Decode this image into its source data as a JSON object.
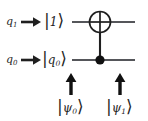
{
  "figure": {
    "type": "quantum-circuit-diagram",
    "background_color": "#ffffff",
    "ink_color": "#1f1f1f"
  },
  "wires": [
    {
      "id": "q1",
      "register_label": "q",
      "register_subscript": "1",
      "arrow": "→",
      "initial_state_ket": {
        "left_bar": "|",
        "inner": "1",
        "inner_subscript": "",
        "right_angle": "⟩",
        "full": "|1⟩"
      },
      "role": "target",
      "gate_symbol": "⊕"
    },
    {
      "id": "q0",
      "register_label": "q",
      "register_subscript": "0",
      "arrow": "→",
      "initial_state_ket": {
        "left_bar": "|",
        "inner": "q",
        "inner_subscript": "0",
        "right_angle": "⟩",
        "full": "|q₀⟩"
      },
      "role": "control",
      "gate_symbol": "●"
    }
  ],
  "gate": {
    "name": "CNOT",
    "target_symbol": "oplus-target-icon",
    "control_symbol": "filled-control-dot-icon",
    "connector": "vertical-line"
  },
  "annotations": [
    {
      "id": "psi0",
      "arrow": "↑",
      "label_bar": "|",
      "label_inner": "ψ",
      "label_subscript": "0",
      "label_angle": "⟩",
      "label_full": "|ψ₀⟩",
      "points_to": "before-gate"
    },
    {
      "id": "psi1",
      "arrow": "↑",
      "label_bar": "|",
      "label_inner": "ψ",
      "label_subscript": "1",
      "label_angle": "⟩",
      "label_full": "|ψ₁⟩",
      "points_to": "after-gate"
    }
  ]
}
